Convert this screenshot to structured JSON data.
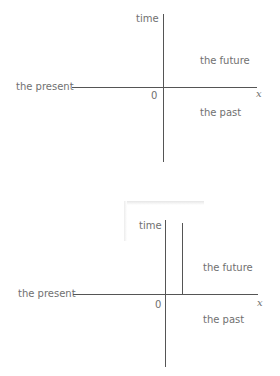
{
  "diagram_top": {
    "y_axis_label": "time",
    "x_axis_label": "x",
    "origin_label": "0",
    "horizontal_label": "the present",
    "upper_region_label": "the future",
    "lower_region_label": "the past"
  },
  "diagram_bottom": {
    "y_axis_label": "time",
    "x_axis_label": "x",
    "origin_label": "0",
    "horizontal_label": "the present",
    "upper_region_label": "the future",
    "lower_region_label": "the past"
  }
}
